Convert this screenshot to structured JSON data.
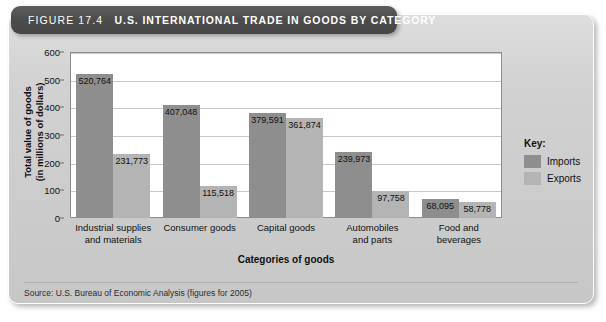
{
  "figure": {
    "label": "FIGURE 17.4",
    "title": "U.S. INTERNATIONAL TRADE IN GOODS BY CATEGORY",
    "source": "Source: U.S. Bureau of Economic Analysis (figures for 2005)"
  },
  "legend": {
    "title": "Key:",
    "entries": [
      {
        "label": "Imports",
        "color": "#8e8e8e"
      },
      {
        "label": "Exports",
        "color": "#b4b4b4"
      }
    ]
  },
  "colors": {
    "imports": "#8e8e8e",
    "exports": "#b4b4b4",
    "banner": "#4d4d4d",
    "card": "#cfcfcf",
    "plot_background": "#ffffff",
    "gridline": "#c9c9c9"
  },
  "chart_data": {
    "type": "bar",
    "title": "U.S. INTERNATIONAL TRADE IN GOODS BY CATEGORY",
    "xlabel": "Categories of goods",
    "ylabel": "Total value of goods (in millions of dollars)",
    "ylabel_line1": "Total value of goods",
    "ylabel_line2": "(in millions of dollars)",
    "ylim": [
      0,
      600
    ],
    "ytick_values": [
      0,
      100,
      200,
      300,
      400,
      500,
      600
    ],
    "ytick_labels": [
      "0",
      "100",
      "200",
      "300",
      "400",
      "500",
      "600"
    ],
    "grid": true,
    "legend_position": "right",
    "units": "millions of dollars",
    "categories": [
      "Industrial supplies and materials",
      "Consumer goods",
      "Capital goods",
      "Automobiles and parts",
      "Food and beverages"
    ],
    "category_lines": [
      [
        "Industrial supplies",
        "and materials"
      ],
      [
        "Consumer goods"
      ],
      [
        "Capital goods"
      ],
      [
        "Automobiles",
        "and parts"
      ],
      [
        "Food and",
        "beverages"
      ]
    ],
    "series": [
      {
        "name": "Imports",
        "color": "#8e8e8e",
        "values": [
          520764,
          407048,
          379591,
          239973,
          68095
        ],
        "labels": [
          "520,764",
          "407,048",
          "379,591",
          "239,973",
          "68,095"
        ]
      },
      {
        "name": "Exports",
        "color": "#b4b4b4",
        "values": [
          231773,
          115518,
          361874,
          97758,
          58778
        ],
        "labels": [
          "231,773",
          "115,518",
          "361,874",
          "97,758",
          "58,778"
        ]
      }
    ]
  }
}
